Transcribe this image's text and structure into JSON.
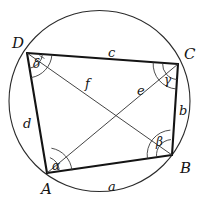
{
  "figure": {
    "kind": "cyclic-quadrilateral-in-circle",
    "stroke_color": "#1a1a1a",
    "thin_stroke_color": "#3a3a3a",
    "background": "#ffffff"
  },
  "circle": {
    "name": "circumcircle",
    "cx": 99.5,
    "cy": 101,
    "r": 90.5
  },
  "vertices": [
    {
      "id": "A",
      "label": "A",
      "x": 47,
      "y": 173,
      "label_x": 41,
      "label_y": 182
    },
    {
      "id": "B",
      "label": "B",
      "x": 172,
      "y": 155,
      "label_x": 180,
      "label_y": 161
    },
    {
      "id": "C",
      "label": "C",
      "x": 178,
      "y": 64,
      "label_x": 184,
      "label_y": 47
    },
    {
      "id": "D",
      "label": "D",
      "x": 27,
      "y": 53,
      "label_x": 12,
      "label_y": 36
    }
  ],
  "sides": [
    {
      "id": "a",
      "label": "a",
      "from": "A",
      "to": "B",
      "label_x": 108,
      "label_y": 180
    },
    {
      "id": "b",
      "label": "b",
      "from": "B",
      "to": "C",
      "label_x": 179,
      "label_y": 104
    },
    {
      "id": "c",
      "label": "c",
      "from": "C",
      "to": "D",
      "label_x": 108,
      "label_y": 46
    },
    {
      "id": "d",
      "label": "d",
      "from": "D",
      "to": "A",
      "label_x": 23,
      "label_y": 117
    }
  ],
  "diagonals": [
    {
      "id": "e",
      "label": "e",
      "from": "A",
      "to": "C",
      "label_x": 137,
      "label_y": 84
    },
    {
      "id": "f",
      "label": "f",
      "from": "D",
      "to": "B",
      "label_x": 85,
      "label_y": 77
    }
  ],
  "angles": [
    {
      "id": "alpha",
      "label": "α",
      "at": "A",
      "label_x": 52,
      "label_y": 160
    },
    {
      "id": "beta",
      "label": "β",
      "at": "B",
      "label_x": 156,
      "label_y": 136
    },
    {
      "id": "gamma",
      "label": "γ",
      "at": "C",
      "label_x": 164,
      "label_y": 74
    },
    {
      "id": "delta",
      "label": "δ",
      "at": "D",
      "label_x": 33,
      "label_y": 58
    }
  ]
}
